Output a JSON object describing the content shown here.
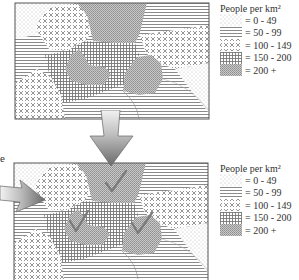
{
  "side_text": "e",
  "legend_title": "People per km²",
  "legend": [
    {
      "label": "= 0 - 49",
      "pattern": "dots"
    },
    {
      "label": "= 50 - 99",
      "pattern": "horizontal-lines"
    },
    {
      "label": "= 100 - 149",
      "pattern": "diamond-crosshatch"
    },
    {
      "label": "= 150 - 200",
      "pattern": "grid"
    },
    {
      "label": "= 200 +",
      "pattern": "dense-dots"
    }
  ],
  "top_map": {
    "description": "Choropleth map of population density"
  },
  "bottom_map": {
    "description": "Same choropleth map with 200+ regions marked with check marks",
    "checkmarks": 3
  },
  "colors": {
    "line": "#666666",
    "arrow_dark": "#666666",
    "arrow_light": "#d8d8d8",
    "check": "#777777"
  }
}
